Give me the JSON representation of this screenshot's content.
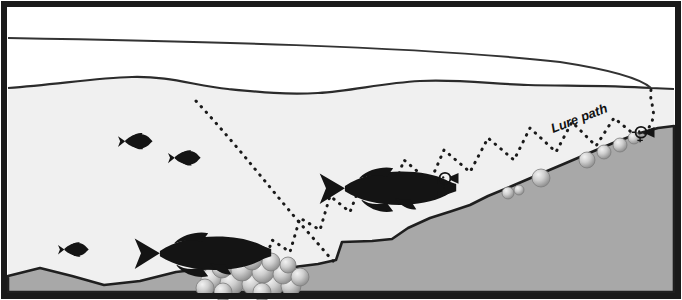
{
  "diagram": {
    "labels": {
      "lure_path": "Lure path"
    },
    "colors": {
      "frame": "#1a1a1a",
      "sky": "#ffffff",
      "water": "#f0f0f0",
      "bottom": "#a8a8a8",
      "bottom_edge": "#1f1f1f",
      "fish": "#141414",
      "rock_light": "#e8e8e8",
      "rock_mid": "#c0c0c0",
      "rock_dark": "#8f8f8f",
      "dotted": "#1a1a1a",
      "line": "#333333"
    },
    "frame": {
      "x": 4,
      "y": 4,
      "width": 674,
      "height": 292,
      "stroke_width": 6
    },
    "fishing_line": {
      "description": "monofilament line from rod entering water at right",
      "path": "M 8 38 C 180 41 420 46 560 62 C 612 70 640 78 651 88",
      "entry_x": 651,
      "entry_y": 88
    },
    "water_surface": {
      "path": "M 8 88 C 60 84 96 78 132 77 C 170 76 196 86 228 89 C 258 92 286 95 318 93 C 352 91 382 83 420 81 C 458 79 492 84 528 85 C 566 86 606 85 651 88 L 674 89"
    },
    "lake_bottom": {
      "path": "M 8 276 L 40 268 L 72 276 L 104 285 L 140 281 L 176 272 L 210 268 L 248 270 L 286 268 L 318 264 L 336 260 L 342 242 L 372 241 L 392 239 L 408 228 L 430 218 L 452 211 L 470 205 L 488 196 L 512 186 L 540 174 L 566 163 L 594 151 L 618 141 L 640 133 L 658 128 L 674 126 L 674 292 L 8 292 Z"
    },
    "pike": [
      {
        "name": "pike-upper",
        "x": 305,
        "y": 163,
        "length": 140,
        "facing": "right"
      },
      {
        "name": "pike-lower",
        "x": 120,
        "y": 228,
        "length": 140,
        "facing": "right"
      }
    ],
    "baitfish": [
      {
        "name": "baitfish-1",
        "x": 118,
        "y": 134,
        "length": 34,
        "facing": "right"
      },
      {
        "name": "baitfish-2",
        "x": 168,
        "y": 151,
        "length": 32,
        "facing": "right"
      },
      {
        "name": "baitfish-3",
        "x": 58,
        "y": 243,
        "length": 30,
        "facing": "right"
      }
    ],
    "lures": [
      {
        "name": "lure-mid-slope",
        "x": 441,
        "y": 178,
        "size": 15
      },
      {
        "name": "lure-upper-right",
        "x": 640,
        "y": 133,
        "size": 15
      }
    ],
    "rock_pile": {
      "description": "cluster of boulders on the flat bottom",
      "center_x": 245,
      "center_y": 272,
      "count": 17
    },
    "slope_rocks": {
      "description": "scattered boulders along the breakline slope",
      "count": 6
    },
    "cast_trajectory": {
      "description": "dotted arc of the cast falling from upper left",
      "path": "M 196 101 C 238 146 276 196 306 230 C 322 248 330 258 334 262"
    },
    "zigzag_retrieve": {
      "description": "sawtooth dotted path of the lure hopping up the slope"
    }
  }
}
